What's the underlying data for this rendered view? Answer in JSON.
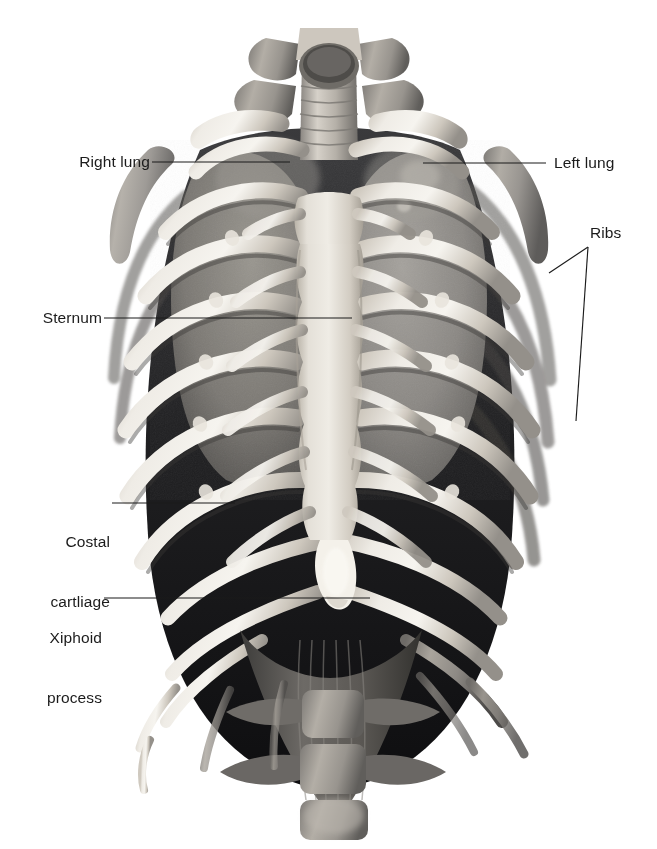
{
  "figure": {
    "width": 657,
    "height": 849,
    "background_color": "#ffffff",
    "style": "grayscale 3D anatomical rendering",
    "label_color": "#1b1b1b",
    "leader_color": "#1b1b1b"
  },
  "labels": [
    {
      "id": "right-lung",
      "text": "Right lung",
      "lines": [
        "Right lung"
      ],
      "side": "left",
      "text_x": 70,
      "text_y": 152,
      "leader": [
        [
          152,
          162
        ],
        [
          290,
          162
        ]
      ]
    },
    {
      "id": "left-lung",
      "text": "Left lung",
      "lines": [
        "Left lung"
      ],
      "side": "right",
      "text_x": 554,
      "text_y": 153,
      "leader": [
        [
          423,
          163
        ],
        [
          546,
          163
        ]
      ]
    },
    {
      "id": "ribs",
      "text": "Ribs",
      "lines": [
        "Ribs"
      ],
      "side": "right",
      "text_x": 590,
      "text_y": 223,
      "leader": [
        [
          588,
          247
        ],
        [
          549,
          273
        ]
      ],
      "leader_second": [
        [
          588,
          247
        ],
        [
          576,
          421
        ]
      ]
    },
    {
      "id": "sternum",
      "text": "Sternum",
      "lines": [
        "Sternum"
      ],
      "side": "left",
      "text_x": 32,
      "text_y": 308,
      "leader": [
        [
          104,
          318
        ],
        [
          352,
          318
        ]
      ]
    },
    {
      "id": "costal-cartilage",
      "text": "Costal cartliage",
      "lines": [
        "Costal",
        "cartliage"
      ],
      "side": "left",
      "text_x": 56,
      "text_y": 492,
      "leader": [
        [
          112,
          503
        ],
        [
          235,
          503
        ]
      ]
    },
    {
      "id": "xiphoid-process",
      "text": "Xiphoid process",
      "lines": [
        "Xiphoid",
        "process"
      ],
      "side": "left",
      "text_x": 36,
      "text_y": 588,
      "leader": [
        [
          104,
          598
        ],
        [
          370,
          598
        ]
      ]
    }
  ],
  "structures": {
    "cervical_vertebrae": "cervical spine",
    "trachea": "trachea",
    "clavicle": "clavicle",
    "scapula": "scapula",
    "ribs": "ribs",
    "sternum": "sternum",
    "xiphoid_process": "xiphoid process",
    "costal_cartilage": "costal cartilage",
    "lungs": "lungs",
    "diaphragm": "diaphragm",
    "lumbar_vertebrae": "lumbar vertebrae"
  },
  "palette": {
    "bone_light": "#f2efe9",
    "bone_mid": "#d8d2c8",
    "bone_shadow": "#8e8a83",
    "lung_tissue": "#8f8d8a",
    "lung_dark": "#5f5d5b",
    "cavity_dark": "#26262a",
    "cavity_black": "#121214",
    "muscle_gray": "#6a6865",
    "background": "#ffffff"
  }
}
